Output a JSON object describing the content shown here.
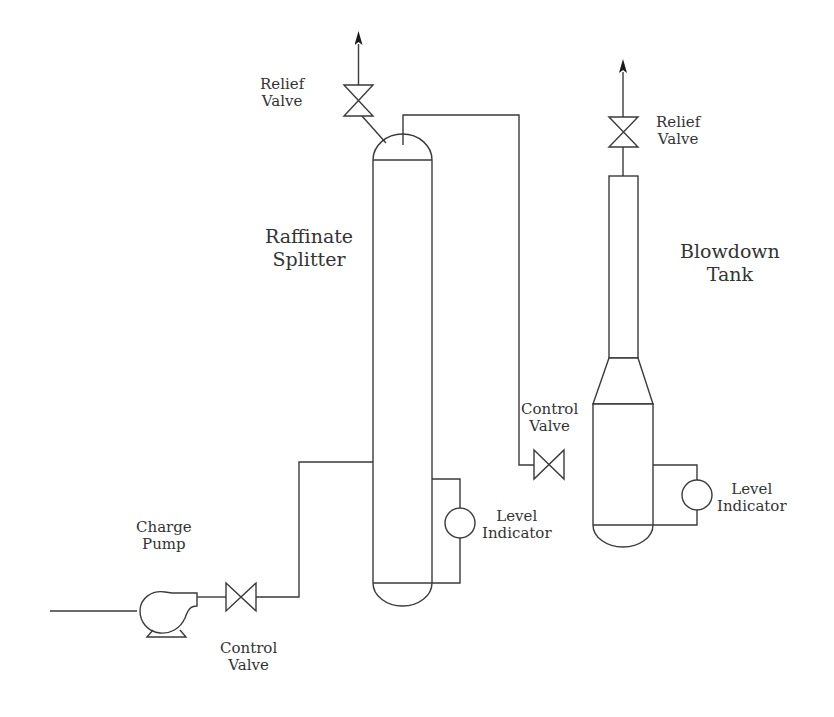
{
  "diagram": {
    "type": "process-flow-diagram",
    "colors": {
      "line": "#3a3a3a",
      "text": "#333333",
      "background": "#ffffff"
    },
    "equipment": {
      "raffinate_splitter": {
        "label_line1": "Raffinate",
        "label_line2": "Splitter"
      },
      "blowdown_tank": {
        "label_line1": "Blowdown",
        "label_line2": "Tank"
      },
      "charge_pump": {
        "label_line1": "Charge",
        "label_line2": "Pump"
      },
      "splitter_relief_valve": {
        "label_line1": "Relief",
        "label_line2": "Valve"
      },
      "tank_relief_valve": {
        "label_line1": "Relief",
        "label_line2": "Valve"
      },
      "feed_control_valve": {
        "label_line1": "Control",
        "label_line2": "Valve"
      },
      "overhead_control_valve": {
        "label_line1": "Control",
        "label_line2": "Valve"
      },
      "splitter_level_indicator": {
        "label_line1": "Level",
        "label_line2": "Indicator"
      },
      "tank_level_indicator": {
        "label_line1": "Level",
        "label_line2": "Indicator"
      }
    },
    "connections": [
      "Feed line -> Charge Pump",
      "Charge Pump -> Control Valve",
      "Control Valve -> Raffinate Splitter (side inlet)",
      "Raffinate Splitter top -> Relief Valve -> vent",
      "Raffinate Splitter overhead -> Control Valve -> Blowdown Tank",
      "Blowdown Tank top -> Relief Valve -> vent",
      "Raffinate Splitter -> Level Indicator",
      "Blowdown Tank -> Level Indicator"
    ]
  }
}
